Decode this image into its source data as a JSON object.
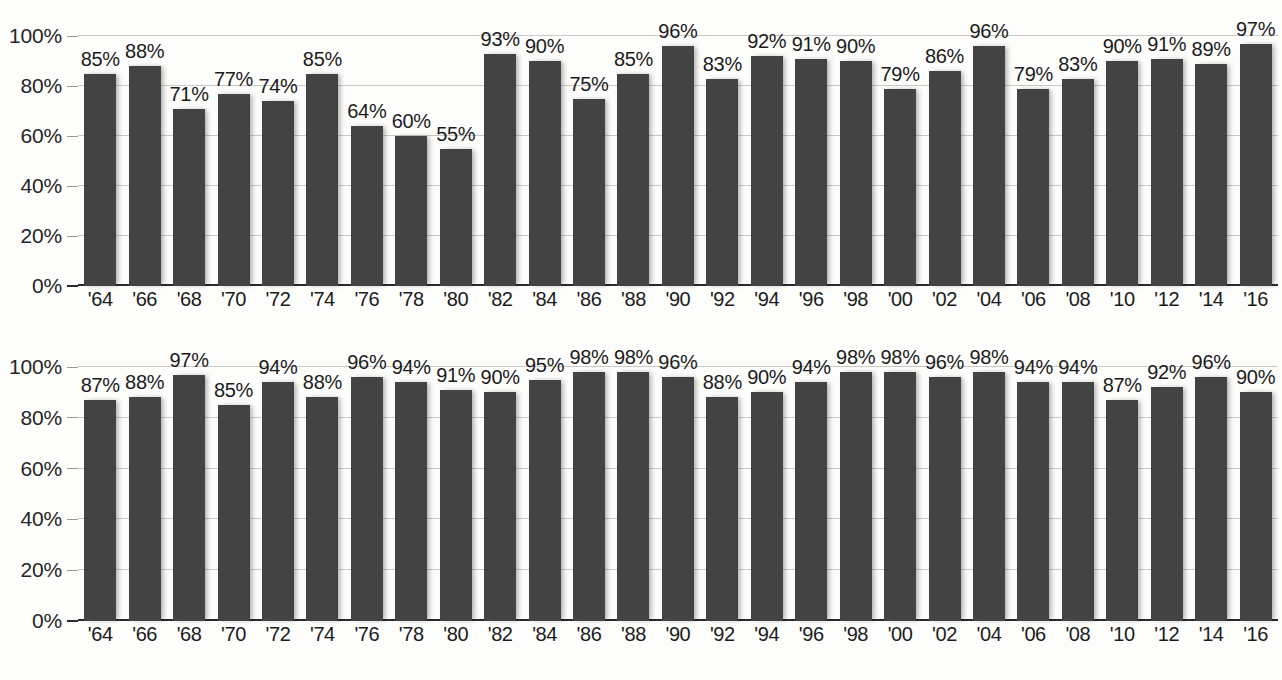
{
  "chart_data": [
    {
      "type": "bar",
      "name": "top-chart",
      "title": "",
      "xlabel": "",
      "ylabel": "",
      "ylim": [
        0,
        100
      ],
      "grid": true,
      "legend": "none",
      "value_labels": true,
      "bar_color": "#434343",
      "yticks": [
        "0%",
        "20%",
        "40%",
        "60%",
        "80%",
        "100%"
      ],
      "ytick_values": [
        0,
        20,
        40,
        60,
        80,
        100
      ],
      "categories": [
        "'64",
        "'66",
        "'68",
        "'70",
        "'72",
        "'74",
        "'76",
        "'78",
        "'80",
        "'82",
        "'84",
        "'86",
        "'88",
        "'90",
        "'92",
        "'94",
        "'96",
        "'98",
        "'00",
        "'02",
        "'04",
        "'06",
        "'08",
        "'10",
        "'12",
        "'14",
        "'16"
      ],
      "values": [
        85,
        88,
        71,
        77,
        74,
        85,
        64,
        60,
        55,
        93,
        90,
        75,
        85,
        96,
        83,
        92,
        91,
        90,
        79,
        86,
        96,
        79,
        83,
        90,
        91,
        89,
        97
      ],
      "labels": [
        "85%",
        "88%",
        "71%",
        "77%",
        "74%",
        "85%",
        "64%",
        "60%",
        "55%",
        "93%",
        "90%",
        "75%",
        "85%",
        "96%",
        "83%",
        "92%",
        "91%",
        "90%",
        "79%",
        "86%",
        "96%",
        "79%",
        "83%",
        "90%",
        "91%",
        "89%",
        "97%"
      ]
    },
    {
      "type": "bar",
      "name": "bottom-chart",
      "title": "",
      "xlabel": "",
      "ylabel": "",
      "ylim": [
        0,
        100
      ],
      "grid": true,
      "legend": "none",
      "value_labels": true,
      "bar_color": "#434343",
      "yticks": [
        "0%",
        "20%",
        "40%",
        "60%",
        "80%",
        "100%"
      ],
      "ytick_values": [
        0,
        20,
        40,
        60,
        80,
        100
      ],
      "categories": [
        "'64",
        "'66",
        "'68",
        "'70",
        "'72",
        "'74",
        "'76",
        "'78",
        "'80",
        "'82",
        "'84",
        "'86",
        "'88",
        "'90",
        "'92",
        "'94",
        "'96",
        "'98",
        "'00",
        "'02",
        "'04",
        "'06",
        "'08",
        "'10",
        "'12",
        "'14",
        "'16"
      ],
      "values": [
        87,
        88,
        97,
        85,
        94,
        88,
        96,
        94,
        91,
        90,
        95,
        98,
        98,
        96,
        88,
        90,
        94,
        98,
        98,
        96,
        98,
        94,
        94,
        87,
        92,
        96,
        90
      ],
      "labels": [
        "87%",
        "88%",
        "97%",
        "85%",
        "94%",
        "88%",
        "96%",
        "94%",
        "91%",
        "90%",
        "95%",
        "98%",
        "98%",
        "96%",
        "88%",
        "90%",
        "94%",
        "98%",
        "98%",
        "96%",
        "98%",
        "94%",
        "94%",
        "87%",
        "92%",
        "96%",
        "90%"
      ]
    }
  ]
}
